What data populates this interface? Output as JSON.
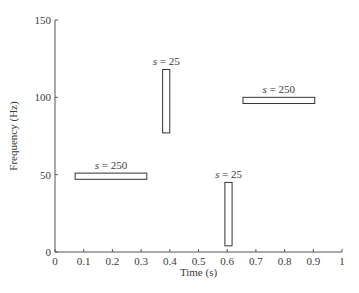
{
  "chart_data": {
    "type": "bar",
    "subtype": "time-frequency tiles",
    "title": "",
    "xlabel": "Time (s)",
    "ylabel": "Frequency (Hz)",
    "xlim": [
      0,
      1
    ],
    "ylim": [
      0,
      150
    ],
    "grid": false,
    "legend": null,
    "x_ticks": [
      "0",
      "0.1",
      "0.2",
      "0.3",
      "0.4",
      "0.5",
      "0.6",
      "0.7",
      "0.8",
      "0.9",
      "1"
    ],
    "y_ticks": [
      "0",
      "50",
      "100",
      "150"
    ],
    "tiles": [
      {
        "label": "s = 250",
        "t_start": 0.07,
        "t_end": 0.32,
        "f_low": 47,
        "f_high": 51
      },
      {
        "label": "s = 25",
        "t_start": 0.375,
        "t_end": 0.4,
        "f_low": 77,
        "f_high": 118
      },
      {
        "label": "s = 250",
        "t_start": 0.655,
        "t_end": 0.905,
        "f_low": 96,
        "f_high": 100
      },
      {
        "label": "s = 25",
        "t_start": 0.592,
        "t_end": 0.617,
        "f_low": 4,
        "f_high": 45
      }
    ]
  },
  "colors": {
    "axis": "#555555",
    "tile_stroke": "#333333",
    "tile_fill": "#ffffff"
  }
}
